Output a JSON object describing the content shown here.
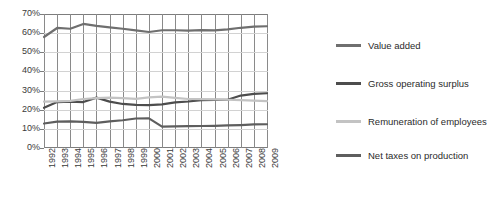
{
  "chart_data": {
    "type": "line",
    "title": "",
    "xlabel": "",
    "ylabel": "",
    "ylim": [
      0,
      70
    ],
    "yticks": [
      "0%",
      "10%",
      "20%",
      "30%",
      "40%",
      "50%",
      "60%",
      "70%"
    ],
    "grid": "vertical gridlines at each year, light horizontal gridlines at each 10%",
    "legend_position": "right",
    "categories": [
      "1992",
      "1993",
      "1994",
      "1995",
      "1996",
      "1997",
      "1998",
      "1999",
      "2000",
      "2001",
      "2002",
      "2003",
      "2004",
      "2005",
      "2006",
      "2007",
      "2008",
      "2009"
    ],
    "series": [
      {
        "name": "Value added",
        "color": "#6f6f6f",
        "values": [
          58.0,
          62.7,
          62.3,
          64.8,
          63.8,
          63.0,
          62.3,
          61.4,
          60.6,
          61.5,
          61.5,
          61.3,
          61.6,
          61.4,
          62.0,
          62.8,
          63.4,
          63.6
        ]
      },
      {
        "name": "Gross operating surplus",
        "color": "#4d4d4d",
        "values": [
          21.0,
          24.0,
          24.2,
          24.0,
          26.3,
          24.2,
          23.0,
          22.5,
          22.4,
          22.8,
          23.8,
          24.3,
          25.0,
          25.1,
          25.2,
          27.4,
          28.3,
          28.6
        ]
      },
      {
        "name": "Remuneration of employees",
        "color": "#c3c3c3",
        "values": [
          24.2,
          24.4,
          24.6,
          25.6,
          26.1,
          26.3,
          26.1,
          25.7,
          26.4,
          26.8,
          26.2,
          25.6,
          25.5,
          25.4,
          25.2,
          25.0,
          24.7,
          24.5
        ]
      },
      {
        "name": "Net taxes on production",
        "color": "#5e5e5e",
        "values": [
          12.8,
          13.8,
          13.9,
          13.6,
          13.1,
          13.9,
          14.5,
          15.4,
          15.5,
          11.2,
          11.3,
          11.4,
          11.5,
          11.6,
          11.8,
          12.0,
          12.3,
          12.4
        ]
      }
    ]
  },
  "legend": {
    "items": [
      {
        "label": "Value added"
      },
      {
        "label": "Gross operating surplus"
      },
      {
        "label": "Remuneration of employees"
      },
      {
        "label": "Net taxes on production"
      }
    ]
  }
}
